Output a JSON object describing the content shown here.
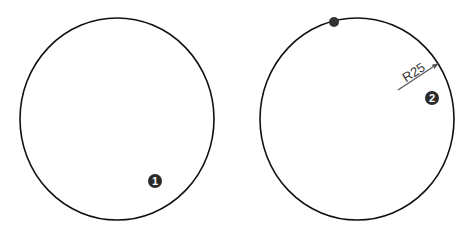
{
  "figures": [
    {
      "id": "circle-1",
      "badge": "1",
      "center": [
        117,
        119
      ],
      "radius": [
        97,
        101
      ],
      "badge_pos": [
        155,
        181
      ]
    },
    {
      "id": "circle-2",
      "badge": "2",
      "center": [
        357,
        119
      ],
      "radius": [
        97,
        101
      ],
      "badge_pos": [
        432,
        98
      ],
      "point_marker": [
        334,
        22
      ],
      "dimension": {
        "label": "R25",
        "line_start": [
          398,
          90
        ],
        "line_end": [
          439,
          63
        ]
      }
    }
  ],
  "colors": {
    "stroke": "#111111",
    "badge": "#2a2a2a",
    "dimension": "#555555",
    "marker": "#333333"
  }
}
